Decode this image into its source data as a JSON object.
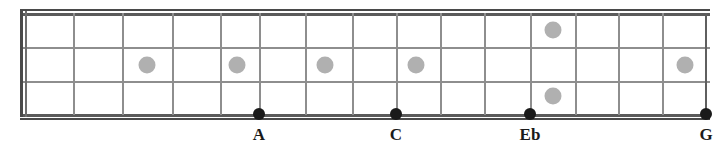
{
  "diagram": {
    "instrument": "4-string bass fretboard",
    "colors": {
      "background": "#ffffff",
      "string": "#8e8e8e",
      "string_outer": "#5b5b5b",
      "fret": "#8e8e8e",
      "nut": "#4a4a4a",
      "inlay": "#b0b0b0",
      "note_dot": "#1a1a1a",
      "label_text": "#1a1a1a"
    }
  },
  "board": {
    "left": 20,
    "right": 710,
    "top": 13,
    "bottom": 115,
    "string_count": 4,
    "string_y": [
      13,
      47,
      81,
      114
    ],
    "fret_count": 15,
    "fret_x": [
      73,
      122,
      172,
      220,
      259,
      305,
      352,
      396,
      440,
      484,
      530,
      575,
      618,
      662,
      705
    ]
  },
  "inlays": [
    {
      "name": "inlay-3",
      "x": 147,
      "y": 65
    },
    {
      "name": "inlay-5",
      "x": 237,
      "y": 65
    },
    {
      "name": "inlay-7",
      "x": 325,
      "y": 65
    },
    {
      "name": "inlay-9",
      "x": 416,
      "y": 65
    },
    {
      "name": "inlay-12-upper",
      "x": 553,
      "y": 30
    },
    {
      "name": "inlay-12-lower",
      "x": 553,
      "y": 96
    },
    {
      "name": "inlay-15",
      "x": 685,
      "y": 65
    }
  ],
  "notes": [
    {
      "label": "A",
      "x": 259,
      "y": 114,
      "string_index": 3
    },
    {
      "label": "C",
      "x": 396,
      "y": 114,
      "string_index": 3
    },
    {
      "label": "Eb",
      "x": 530,
      "y": 114,
      "string_index": 3
    },
    {
      "label": "G",
      "x": 706,
      "y": 114,
      "string_index": 3
    }
  ],
  "label_y": 126
}
